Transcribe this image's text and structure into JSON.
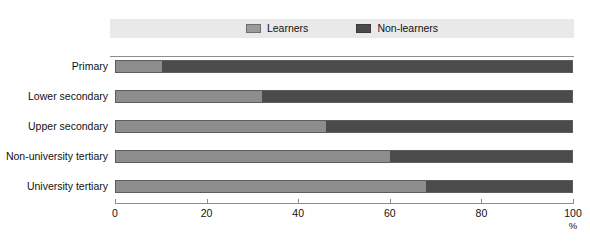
{
  "chart_data": {
    "type": "bar",
    "orientation": "horizontal",
    "stacked": true,
    "normalized": "100%",
    "title": "",
    "subtitle": "",
    "xlabel": "%",
    "ylabel": "",
    "xlim": [
      0,
      100
    ],
    "xticks": [
      0,
      20,
      40,
      60,
      80,
      100
    ],
    "xtick_labels": [
      "0",
      "20",
      "40",
      "60",
      "80",
      "100"
    ],
    "grid": false,
    "legend_position": "top",
    "categories": [
      "Primary",
      "Lower secondary",
      "Upper secondary",
      "Non-university tertiary",
      "University tertiary"
    ],
    "series": [
      {
        "name": "Learners",
        "color": "#8d8d8d",
        "values": [
          10,
          32,
          46,
          60,
          68
        ]
      },
      {
        "name": "Non-learners",
        "color": "#4b4b4b",
        "values": [
          90,
          68,
          54,
          40,
          32
        ]
      }
    ]
  },
  "legend": {
    "entries": [
      {
        "label": "Learners",
        "swatch": "learners"
      },
      {
        "label": "Non-learners",
        "swatch": "nonlearners"
      }
    ]
  },
  "axis": {
    "unit_label": "%"
  },
  "colors": {
    "learners": "#8d8d8d",
    "nonlearners": "#4b4b4b",
    "legend_band": "#e9e9e9",
    "rule": "#8d8d8d",
    "text": "#111111",
    "background": "#ffffff"
  }
}
